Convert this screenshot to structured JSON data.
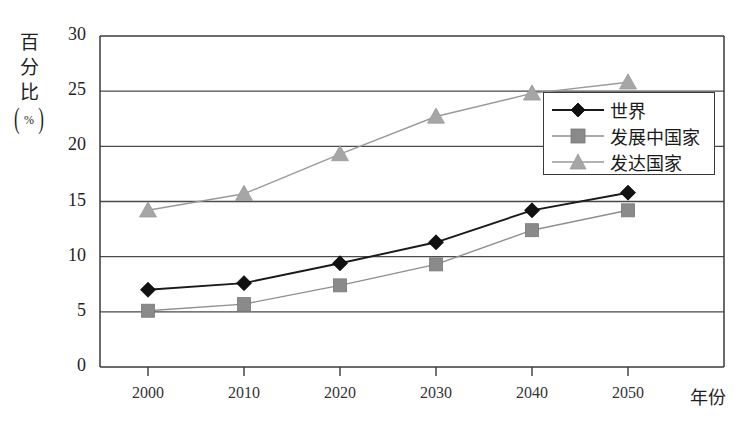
{
  "chart_data": {
    "type": "line",
    "title": "",
    "xlabel": "年份",
    "ylabel": "百分比(%)",
    "ylabel_chars": [
      "百",
      "分",
      "比"
    ],
    "ylabel_unit": "%",
    "categories": [
      "2000",
      "2010",
      "2020",
      "2030",
      "2040",
      "2050"
    ],
    "x": [
      2000,
      2010,
      2020,
      2030,
      2040,
      2050
    ],
    "xlim": [
      1995,
      2060
    ],
    "ylim": [
      0,
      30
    ],
    "yticks": [
      "0",
      "5",
      "10",
      "15",
      "20",
      "25",
      "30"
    ],
    "ytick_values": [
      0,
      5,
      10,
      15,
      20,
      25,
      30
    ],
    "grid": true,
    "grid_axis": "y",
    "legend_position": "right-upper-inside",
    "series": [
      {
        "name": "世界",
        "marker": "diamond",
        "color": "#111111",
        "line_color": "#1a1a1a",
        "values": [
          7.0,
          7.6,
          9.4,
          11.3,
          14.2,
          15.8
        ]
      },
      {
        "name": "发展中国家",
        "marker": "square",
        "color": "#8a8a8a",
        "line_color": "#8f8f8f",
        "values": [
          5.1,
          5.7,
          7.4,
          9.3,
          12.4,
          14.2
        ]
      },
      {
        "name": "发达国家",
        "marker": "triangle",
        "color": "#a6a6a6",
        "line_color": "#9a9a9a",
        "values": [
          14.2,
          15.7,
          19.3,
          22.7,
          24.8,
          25.8
        ]
      }
    ]
  },
  "colors": {
    "axis": "#3a3a3a",
    "grid": "#4a4a4a",
    "background": "#ffffff"
  }
}
